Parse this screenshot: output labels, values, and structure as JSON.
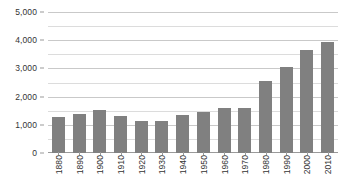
{
  "chart_data": {
    "type": "bar",
    "title": "",
    "xlabel": "",
    "ylabel": "",
    "categories": [
      "1880",
      "1890",
      "1900",
      "1910",
      "1920",
      "1930",
      "1940",
      "1950",
      "1960",
      "1970",
      "1980",
      "1990",
      "2000",
      "2010"
    ],
    "values": [
      1260,
      1400,
      1520,
      1330,
      1150,
      1120,
      1360,
      1450,
      1600,
      1600,
      2550,
      3060,
      3650,
      3930
    ],
    "ylim": [
      0,
      5000
    ],
    "xlim_note": "categorical",
    "y_major_ticks": [
      0,
      1000,
      2000,
      3000,
      4000,
      5000
    ],
    "y_tick_labels": [
      "0",
      "1,000",
      "2,000",
      "3,000",
      "4,000",
      "5,000"
    ],
    "y_minor_ticks": [
      500,
      1500,
      2500,
      3500,
      4500
    ],
    "grid": true,
    "grid_axis": "y",
    "legend": false,
    "legend_position": "none",
    "series": [
      {
        "name": "value",
        "color": "#808080",
        "values": [
          1260,
          1400,
          1520,
          1330,
          1150,
          1120,
          1360,
          1450,
          1600,
          1600,
          2550,
          3060,
          3650,
          3930
        ]
      }
    ],
    "xtick_rotation": 90
  },
  "style": {
    "bar_color": "#808080",
    "gridline_color": "#c9c9c9",
    "minor_gridline_color": "#dcdcdc",
    "axis_color": "#9a9a9a",
    "text_color": "#333333",
    "background": "#ffffff"
  }
}
